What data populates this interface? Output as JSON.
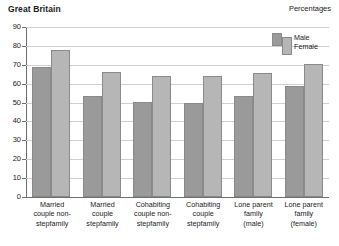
{
  "header": {
    "title": "Great Britain",
    "units": "Percentages"
  },
  "legend": {
    "male_label": "Male",
    "female_label": "Female"
  },
  "chart_data": {
    "type": "bar",
    "title": "Great Britain",
    "subtitle": "Percentages",
    "xlabel": "",
    "ylabel": "",
    "ylim": [
      0,
      90
    ],
    "ytick_step": 10,
    "yticks": [
      0,
      10,
      20,
      30,
      40,
      50,
      60,
      70,
      80,
      90
    ],
    "ytick_labels": [
      "0",
      "10",
      "20",
      "30",
      "40",
      "50",
      "60",
      "70",
      "80",
      "90"
    ],
    "grid": true,
    "grid_axis": "y",
    "legend_position": "top-right",
    "categories": [
      "Married couple non-stepfamily",
      "Married couple stepfamily",
      "Cohabiting couple non-stepfamily",
      "Cohabiting couple stepfamily",
      "Lone parent family (male)",
      "Lone parent family (female)"
    ],
    "category_lines": [
      [
        "Married",
        "couple non-",
        "stepfamily"
      ],
      [
        "Married",
        "couple",
        "stepfamily"
      ],
      [
        "Cohabiting",
        "couple non-",
        "stepfamily"
      ],
      [
        "Cohabiting",
        "couple",
        "stepfamily"
      ],
      [
        "Lone parent",
        "family",
        "(male)"
      ],
      [
        "Lone parent",
        "family",
        "(female)"
      ]
    ],
    "series": [
      {
        "name": "Male",
        "color": "#9a9a9a",
        "values": [
          69,
          53.5,
          50.5,
          50,
          53.5,
          59
        ]
      },
      {
        "name": "Female",
        "color": "#b6b6b6",
        "values": [
          78,
          66,
          64,
          64,
          65.5,
          70.5
        ]
      }
    ]
  }
}
